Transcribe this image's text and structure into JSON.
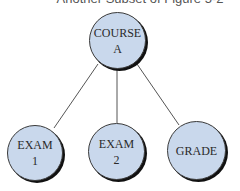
{
  "caption": "Another Subset of Figure 5-2",
  "diagram": {
    "type": "tree",
    "colors": {
      "node_fill": "#c9d8ec",
      "node_border": "#111111",
      "edge": "#555555"
    },
    "root": {
      "id": "course_a",
      "lines": [
        "COURSE",
        "A"
      ]
    },
    "children": [
      {
        "id": "exam_1",
        "lines": [
          "EXAM",
          "1"
        ]
      },
      {
        "id": "exam_2",
        "lines": [
          "EXAM",
          "2"
        ]
      },
      {
        "id": "grade",
        "lines": [
          "GRADE"
        ]
      }
    ],
    "edges": [
      {
        "from": "course_a",
        "to": "exam_1"
      },
      {
        "from": "course_a",
        "to": "exam_2"
      },
      {
        "from": "course_a",
        "to": "grade"
      }
    ]
  }
}
